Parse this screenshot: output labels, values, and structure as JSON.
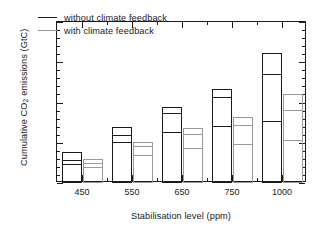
{
  "chart_data": {
    "type": "bar",
    "title": "",
    "xlabel": "Stabilisation level (ppm)",
    "ylabel": "Cumulative CO2 emissions (GtC)",
    "ylabel_pre": "Cumulative CO",
    "ylabel_sub": "2",
    "ylabel_post": " emissions (GtC)",
    "categories": [
      "450",
      "550",
      "650",
      "750",
      "1000"
    ],
    "ylim": [
      0,
      4000
    ],
    "yticks": [
      0,
      1000,
      2000,
      3000,
      4000
    ],
    "ytick_labels": [
      "0",
      "1000",
      "2000",
      "3000",
      "4000"
    ],
    "yminor_step": 200,
    "grid": false,
    "legend_position": "upper left",
    "series": [
      {
        "name": "without climate feedback",
        "color": "#1a1a1a",
        "ranges": [
          {
            "category": "450",
            "low": 490,
            "mid": 590,
            "high": 780
          },
          {
            "category": "550",
            "low": 1010,
            "mid": 1190,
            "high": 1380
          },
          {
            "category": "650",
            "low": 1270,
            "mid": 1740,
            "high": 1890
          },
          {
            "category": "750",
            "low": 1410,
            "mid": 2140,
            "high": 2330
          },
          {
            "category": "1000",
            "low": 1550,
            "mid": 2730,
            "high": 3240
          }
        ]
      },
      {
        "name": "with climate feedback",
        "color": "#9a9a9a",
        "ranges": [
          {
            "category": "450",
            "low": 390,
            "mid": 500,
            "high": 590
          },
          {
            "category": "550",
            "low": 690,
            "mid": 920,
            "high": 1020
          },
          {
            "category": "650",
            "low": 880,
            "mid": 1220,
            "high": 1370
          },
          {
            "category": "750",
            "low": 980,
            "mid": 1460,
            "high": 1650
          },
          {
            "category": "1000",
            "low": 1070,
            "mid": 1820,
            "high": 2220
          }
        ]
      }
    ]
  },
  "legend": {
    "items": [
      {
        "label": "without climate feedback",
        "color": "#1a1a1a"
      },
      {
        "label": "with climate feedback",
        "color": "#9a9a9a"
      }
    ]
  }
}
